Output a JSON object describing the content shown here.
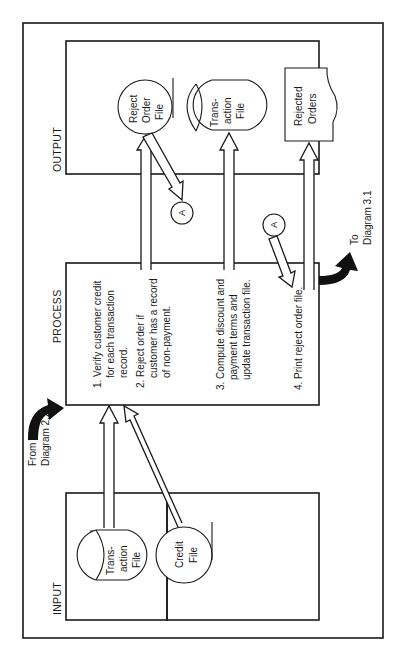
{
  "diagram": {
    "orientation": "rotated 90 degrees counterclockwise",
    "sections": {
      "input": {
        "label": "INPUT"
      },
      "process": {
        "label": "PROCESS"
      },
      "output": {
        "label": "OUTPUT"
      }
    },
    "input_files": [
      {
        "shape": "cylinder",
        "lines": [
          "Trans-",
          "action",
          "File"
        ]
      },
      {
        "shape": "circle",
        "lines": [
          "Credit",
          "File"
        ]
      }
    ],
    "process_steps": [
      {
        "lines": [
          "1. Verify customer credit",
          "for each transaction",
          "record."
        ]
      },
      {
        "lines": [
          "2. Reject order if",
          "customer has a record",
          "of non-payment."
        ]
      },
      {
        "lines": [
          "3. Compute discount and",
          "payment terms and",
          "update transaction file."
        ]
      },
      {
        "lines": [
          "4. Print reject order file."
        ]
      }
    ],
    "output_files": [
      {
        "shape": "circle",
        "lines": [
          "Reject",
          "Order",
          "File"
        ]
      },
      {
        "shape": "cylinder",
        "lines": [
          "Trans-",
          "action",
          "File"
        ]
      },
      {
        "shape": "document",
        "lines": [
          "Rejected",
          "Orders"
        ]
      }
    ],
    "connectors": [
      {
        "label": "A"
      },
      {
        "label": "A"
      }
    ],
    "from_note": {
      "lines": [
        "From",
        "Diagram 2.2"
      ]
    },
    "to_note": {
      "lines": [
        "To",
        "Diagram 3.1"
      ]
    }
  }
}
